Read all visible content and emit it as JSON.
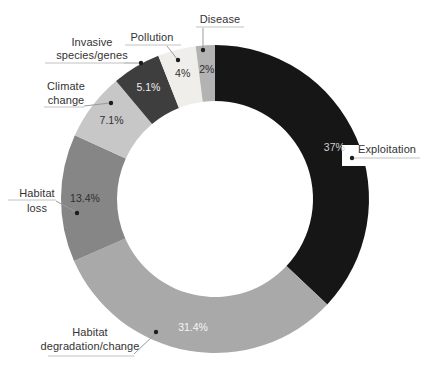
{
  "chart_data": {
    "type": "pie",
    "subtype": "donut",
    "title": "",
    "unit": "%",
    "legend": "none",
    "categories": [
      "Exploitation",
      "Habitat degradation/change",
      "Habitat loss",
      "Climate change",
      "Invasive species/genes",
      "Pollution",
      "Disease"
    ],
    "values": [
      37,
      31.4,
      13.4,
      7.1,
      5.1,
      4,
      2
    ],
    "segments": [
      {
        "label": "Exploitation",
        "label_lines": [
          "Exploitation"
        ],
        "value": 37,
        "pct_text": "37%",
        "color": "#161616",
        "pct_color": "#cfcfcf"
      },
      {
        "label": "Habitat degradation/change",
        "label_lines": [
          "Habitat",
          "degradation/change"
        ],
        "value": 31.4,
        "pct_text": "31.4%",
        "color": "#a9a9a9",
        "pct_color": "#f5f5f5"
      },
      {
        "label": "Habitat loss",
        "label_lines": [
          "Habitat",
          "loss"
        ],
        "value": 13.4,
        "pct_text": "13.4%",
        "color": "#868686",
        "pct_color": "#2f2f2f"
      },
      {
        "label": "Climate change",
        "label_lines": [
          "Climate",
          "change"
        ],
        "value": 7.1,
        "pct_text": "7.1%",
        "color": "#c7c7c7",
        "pct_color": "#2f2f2f"
      },
      {
        "label": "Invasive species/genes",
        "label_lines": [
          "Invasive",
          "species/genes"
        ],
        "value": 5.1,
        "pct_text": "5.1%",
        "color": "#3e3e3e",
        "pct_color": "#ededed"
      },
      {
        "label": "Pollution",
        "label_lines": [
          "Pollution"
        ],
        "value": 4,
        "pct_text": "4%",
        "color": "#efeeea",
        "pct_color": "#2f2f2f"
      },
      {
        "label": "Disease",
        "label_lines": [
          "Disease"
        ],
        "value": 2,
        "pct_text": "2%",
        "color": "#b3b3b3",
        "pct_color": "#2f2f2f"
      }
    ],
    "layout": {
      "cx": 215,
      "cy": 199,
      "outer_radius": 154,
      "inner_radius": 98,
      "pct_label_radius": 130,
      "start": "top",
      "direction": "clockwise",
      "label_bg": {
        "x": 342,
        "y": 145,
        "width": 88,
        "height": 21,
        "color": "#ffffff"
      },
      "annotations": [
        {
          "rule": [
            352,
            158,
            420,
            158
          ],
          "leader": null,
          "dot": [
            352,
            158
          ]
        },
        {
          "rule": [
            48,
            356,
            134,
            356
          ],
          "leader": [
            134,
            354,
            155,
            334
          ],
          "dot": [
            156,
            332
          ]
        },
        {
          "rule": [
            8,
            200,
            56,
            200
          ],
          "leader": [
            56,
            201,
            76,
            212
          ],
          "dot": [
            77,
            213
          ]
        },
        {
          "rule": [
            44,
            107,
            84,
            107
          ],
          "leader": [
            84,
            106,
            110,
            103
          ],
          "dot": [
            111,
            103
          ]
        },
        {
          "rule": [
            45,
            63,
            124,
            63
          ],
          "leader": [
            124,
            63,
            139,
            63
          ],
          "dot": [
            141,
            63
          ]
        },
        {
          "rule": [
            125,
            45,
            181,
            45
          ],
          "leader": [
            167,
            46,
            177,
            59
          ],
          "dot": [
            178,
            60
          ]
        },
        {
          "rule": [
            196,
            27,
            244,
            27
          ],
          "leader": [
            203,
            28,
            203,
            48
          ],
          "dot": [
            203,
            50
          ]
        }
      ]
    },
    "colors": {
      "background": "#ffffff",
      "leader_line": "#9b9b9b",
      "rule_line": "#c2c2c2",
      "dot": "#1c1c1c",
      "label_text": "#333333"
    },
    "pct_font_size": 10.5
  }
}
